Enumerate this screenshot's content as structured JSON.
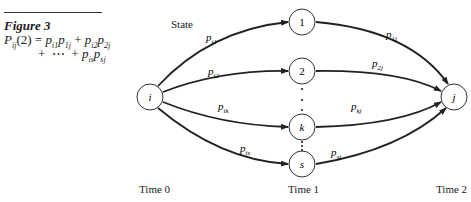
{
  "figure": {
    "title": "Figure 3",
    "equation": {
      "lhs": "P",
      "lhs_sub": "ij",
      "lhs_arg": "(2)",
      "line1_terms": [
        {
          "a": "p",
          "a_sub": "i1",
          "b": "p",
          "b_sub": "1j"
        },
        {
          "a": "p",
          "a_sub": "i2",
          "b": "p",
          "b_sub": "2j"
        }
      ],
      "line2_ellipsis": "+  ⋯  +",
      "line2_term": {
        "a": "p",
        "a_sub": "is",
        "b": "p",
        "b_sub": "sj"
      }
    }
  },
  "diagram": {
    "state_label": "State",
    "nodes": [
      {
        "id": "i",
        "label": "i",
        "x": 150,
        "y": 97,
        "italic": true
      },
      {
        "id": "1",
        "label": "1",
        "x": 302,
        "y": 22,
        "italic": false
      },
      {
        "id": "2",
        "label": "2",
        "x": 302,
        "y": 71,
        "italic": false
      },
      {
        "id": "k",
        "label": "k",
        "x": 302,
        "y": 127,
        "italic": true
      },
      {
        "id": "s",
        "label": "s",
        "x": 302,
        "y": 164,
        "italic": true
      },
      {
        "id": "j",
        "label": "j",
        "x": 454,
        "y": 97,
        "italic": true
      }
    ],
    "edges": [
      {
        "from": "i",
        "to": "1",
        "label": "p",
        "sub": "i1"
      },
      {
        "from": "i",
        "to": "2",
        "label": "p",
        "sub": "i2"
      },
      {
        "from": "i",
        "to": "k",
        "label": "p",
        "sub": "ik"
      },
      {
        "from": "i",
        "to": "s",
        "label": "p",
        "sub": "is"
      },
      {
        "from": "1",
        "to": "j",
        "label": "p",
        "sub": "1j"
      },
      {
        "from": "2",
        "to": "j",
        "label": "p",
        "sub": "2j"
      },
      {
        "from": "k",
        "to": "j",
        "label": "p",
        "sub": "kj"
      },
      {
        "from": "s",
        "to": "j",
        "label": "p",
        "sub": "sj"
      }
    ],
    "time_labels": [
      "Time 0",
      "Time 1",
      "Time 2"
    ]
  }
}
